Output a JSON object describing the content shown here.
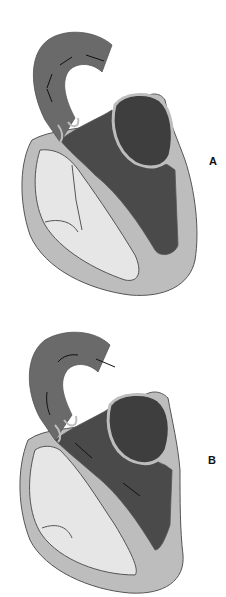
{
  "figure": {
    "panels": [
      {
        "id": "A",
        "label": "A",
        "description": "Heart cross-section; aorta with bidirectional arrows"
      },
      {
        "id": "B",
        "label": "B",
        "description": "Heart cross-section; forward flow arrows from ventricle through aorta"
      }
    ]
  },
  "colors": {
    "background": "#ffffff",
    "wall": "#bdbdbd",
    "outline": "#555555",
    "light_chamber": "#e6e6e6",
    "dark_chamber": "#4a4a4a",
    "aorta": "#6a6a6a",
    "arrow": "#111111"
  }
}
